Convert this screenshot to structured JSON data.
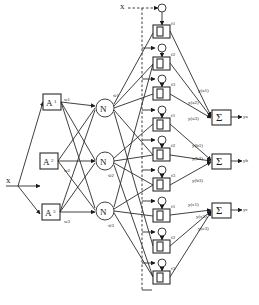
{
  "diagram": {
    "type": "neuro-fuzzy network (ANFIS-style) block diagram",
    "input": {
      "label": "x",
      "top_label": "x"
    },
    "membership_nodes": [
      {
        "label": "A",
        "sub": "1",
        "weight": "w1"
      },
      {
        "label": "A",
        "sub": "2",
        "weight": "w2"
      },
      {
        "label": "A",
        "sub": "3",
        "weight": "w3"
      }
    ],
    "normalization_nodes": [
      {
        "label": "N",
        "weight": "w̄1"
      },
      {
        "label": "N",
        "weight": "w̄2"
      },
      {
        "label": "N",
        "weight": "w̄3"
      }
    ],
    "rule_blocks": [
      {
        "label": "Π",
        "f": "f1"
      },
      {
        "label": "Π",
        "f": "f2"
      },
      {
        "label": "Π",
        "f": "f3"
      },
      {
        "label": "Π",
        "f": "f1"
      },
      {
        "label": "Π",
        "f": "f2"
      },
      {
        "label": "Π",
        "f": "f3"
      },
      {
        "label": "Π",
        "f": "f1"
      },
      {
        "label": "Π",
        "f": "f2"
      },
      {
        "label": "Π",
        "f": "f3"
      }
    ],
    "partial_outputs": [
      "y(a1)",
      "y(a2)",
      "y(a3)",
      "y(b1)",
      "y(b2)",
      "y(b3)",
      "y(c1)",
      "y(c2)",
      "y(c3)"
    ],
    "sum_nodes": [
      {
        "label": "Σ",
        "output": "ya"
      },
      {
        "label": "Σ",
        "output": "yb"
      },
      {
        "label": "Σ",
        "output": "yc"
      }
    ]
  }
}
